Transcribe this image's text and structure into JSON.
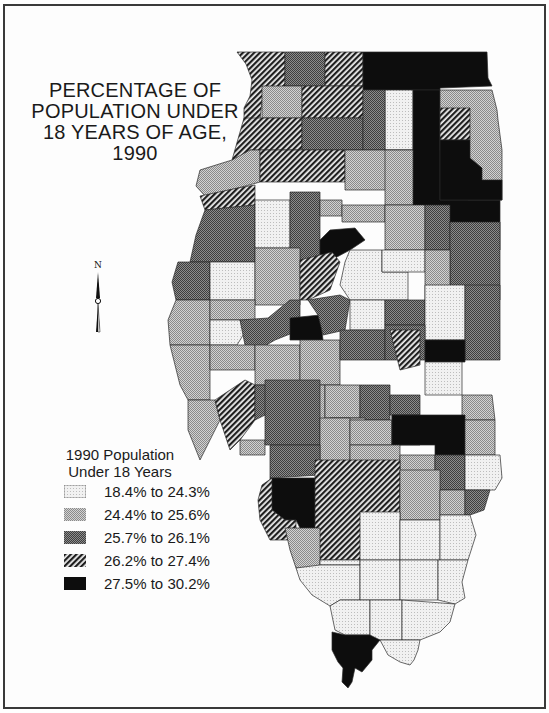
{
  "title": {
    "lines": [
      "PERCENTAGE OF",
      "POPULATION UNDER",
      "18 YEARS OF AGE,",
      "1990"
    ]
  },
  "compass": {
    "label": "N",
    "icon": "north-arrow-icon"
  },
  "legend": {
    "title_lines": [
      "1990 Population",
      "Under 18 Years"
    ],
    "classes": [
      {
        "label": "18.4% to 24.3%",
        "pattern": "light-dot",
        "color": "#eaeaea"
      },
      {
        "label": "24.4% to 25.6%",
        "pattern": "medium-dot",
        "color": "#b4b4b4"
      },
      {
        "label": "25.7% to 26.1%",
        "pattern": "dark-dot",
        "color": "#6e6e6e"
      },
      {
        "label": "26.2% to 27.4%",
        "pattern": "diagonal-hatch",
        "color": "#3a3a3a"
      },
      {
        "label": "27.5% to 30.2%",
        "pattern": "solid-black",
        "color": "#0d0d0d"
      }
    ]
  },
  "map": {
    "region": "Illinois",
    "unit": "county",
    "year": "1990"
  }
}
